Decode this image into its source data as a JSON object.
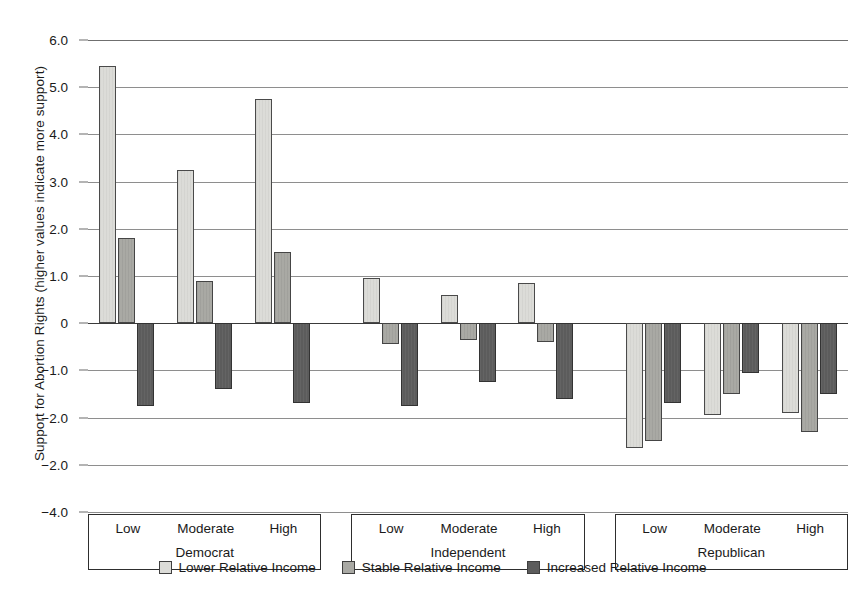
{
  "chart_data": {
    "type": "bar",
    "title": "",
    "xlabel": "",
    "ylabel": "Support for Abortion Rights (higher values indicate more support)",
    "ylim": [
      -4.0,
      6.0
    ],
    "grid": true,
    "legend_position": "bottom",
    "y_tick_labels": [
      "6.0",
      "5.0",
      "4.0",
      "3.0",
      "2.0",
      "1.0",
      "0",
      "−1.0",
      "−2.0",
      "−2.0",
      "−4.0"
    ],
    "y_tick_values": [
      6.0,
      5.0,
      4.0,
      3.0,
      2.0,
      1.0,
      0,
      -1.0,
      -2.0,
      -3.0,
      -4.0
    ],
    "groups": [
      {
        "name": "Democrat",
        "categories": [
          "Low",
          "Moderate",
          "High"
        ]
      },
      {
        "name": "Independent",
        "categories": [
          "Low",
          "Moderate",
          "High"
        ]
      },
      {
        "name": "Republican",
        "categories": [
          "Low",
          "Moderate",
          "High"
        ]
      }
    ],
    "categories": [
      "Democrat / Low",
      "Democrat / Moderate",
      "Democrat / High",
      "Independent / Low",
      "Independent / Moderate",
      "Independent / High",
      "Republican / Low",
      "Republican / Moderate",
      "Republican / High"
    ],
    "series": [
      {
        "name": "Lower Relative Income",
        "color": "#dcdcd8",
        "values": [
          5.45,
          3.25,
          4.75,
          0.95,
          0.6,
          0.85,
          -2.65,
          -1.95,
          -1.9
        ]
      },
      {
        "name": "Stable Relative Income",
        "color": "#a9a9a4",
        "values": [
          1.8,
          0.9,
          1.5,
          -0.45,
          -0.35,
          -0.4,
          -2.5,
          -1.5,
          -2.3
        ]
      },
      {
        "name": "Increased Relative Income",
        "color": "#5c5c5c",
        "values": [
          -1.75,
          -1.4,
          -1.7,
          -1.75,
          -1.25,
          -1.6,
          -1.7,
          -1.05,
          -1.5
        ]
      }
    ]
  },
  "legend": {
    "items": [
      {
        "label": "Lower Relative Income"
      },
      {
        "label": "Stable Relative Income"
      },
      {
        "label": "Increased Relative Income"
      }
    ]
  }
}
